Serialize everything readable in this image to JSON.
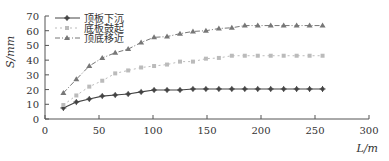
{
  "chart_data": {
    "type": "line",
    "title": "",
    "xlabel": "L/m",
    "ylabel": "S/mm",
    "xlim": [
      0,
      300
    ],
    "ylim": [
      0,
      70
    ],
    "xticks": [
      0,
      50,
      100,
      150,
      200,
      250,
      300
    ],
    "yticks": [
      0,
      10,
      20,
      30,
      40,
      50,
      60,
      70
    ],
    "grid": false,
    "legend_position": "upper-left",
    "x": [
      17,
      29,
      41,
      53,
      65,
      77,
      89,
      101,
      113,
      125,
      137,
      149,
      161,
      173,
      185,
      197,
      209,
      221,
      233,
      245,
      257
    ],
    "series": [
      {
        "name": "顶板下沉",
        "marker": "plus-dot",
        "line": "solid",
        "color": "#444444",
        "values": [
          7.5,
          11.5,
          13.6,
          15.6,
          16.3,
          17.0,
          18.4,
          19.7,
          19.7,
          19.7,
          20.4,
          20.4,
          20.4,
          20.4,
          20.4,
          20.4,
          20.4,
          20.4,
          20.4,
          20.4,
          20.4
        ]
      },
      {
        "name": "底板鼓起",
        "marker": "square",
        "line": "dotted",
        "color": "#bbbbbb",
        "values": [
          9.5,
          16,
          22,
          26,
          31,
          33,
          35,
          36,
          37,
          39,
          39,
          41,
          41.5,
          43,
          43,
          43,
          43,
          43,
          43,
          43,
          43
        ]
      },
      {
        "name": "顶底移近",
        "marker": "triangle",
        "line": "dash-dot",
        "color": "#777777",
        "values": [
          17.7,
          27,
          36,
          41.5,
          45,
          47.5,
          52,
          55.5,
          56,
          58,
          59.5,
          60,
          61.5,
          62,
          63.5,
          63.5,
          63.5,
          63.5,
          63.5,
          63.5,
          63.5
        ]
      }
    ]
  },
  "axis": {
    "ylabel": "S/mm",
    "xlabel": "L/m"
  }
}
